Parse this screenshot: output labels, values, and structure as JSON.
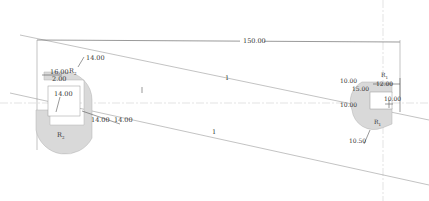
{
  "drawing": {
    "overall_dimension": "150.00",
    "construction_labels": {
      "upper": "1",
      "lower": "1"
    },
    "left_part": {
      "radius_top_label": "R",
      "radius_top_sub": "2",
      "radius_bottom_label": "R",
      "radius_bottom_sub": "2",
      "dims": {
        "top_leader": "14.00",
        "width_outer": "16.00",
        "inner_offset": "2.00",
        "height": "14.00",
        "bottom_a": "14.00",
        "bottom_b": "14.00"
      }
    },
    "right_part": {
      "radius_top_label": "R",
      "radius_top_sub": "1",
      "radius_bottom_label": "R",
      "radius_bottom_sub": "1",
      "dims": {
        "left_top": "10.00",
        "left_mid": "15.00",
        "left_center": "10.00",
        "top_width": "12.00",
        "right_height": "10.00",
        "bottom_leader": "10.50"
      }
    },
    "colors": {
      "part_fill": "#d9d9d9",
      "line": "#9a9a9a",
      "text": "#333333"
    }
  }
}
